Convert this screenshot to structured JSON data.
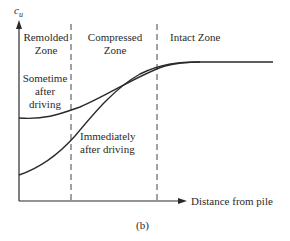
{
  "figure": {
    "y_axis_label_main": "c",
    "y_axis_label_sub": "u",
    "x_axis_label": "Distance from pile",
    "caption": "(b)",
    "zones": [
      {
        "line1": "Remolded",
        "line2": "Zone"
      },
      {
        "line1": "Compressed",
        "line2": "Zone"
      },
      {
        "line1": "Intact Zone",
        "line2": ""
      }
    ],
    "curves": [
      {
        "line1": "Sometime",
        "line2": "after",
        "line3": "driving"
      },
      {
        "line1": "Immediately",
        "line2": "after driving"
      }
    ],
    "colors": {
      "line": "#2a2a2a",
      "background": "#ffffff"
    }
  }
}
